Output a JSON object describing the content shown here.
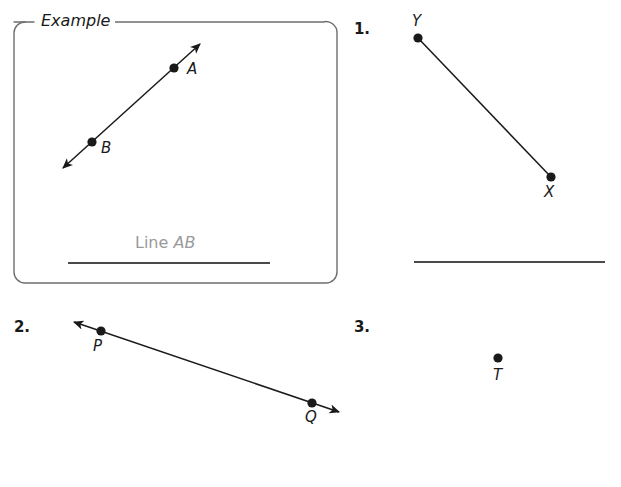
{
  "page": {
    "background_color": "#ffffff",
    "ink_color": "#1a1a1a",
    "answer_ink_color": "#9a9a9a",
    "rule_color": "#555555"
  },
  "example_box": {
    "title": "Example",
    "answer_prefix": "Line ",
    "answer_names": "AB",
    "figure": {
      "type": "line",
      "arrow_start": true,
      "arrow_end": true,
      "points": [
        {
          "label": "A",
          "x": 174,
          "y": 68
        },
        {
          "label": "B",
          "x": 92,
          "y": 142
        }
      ]
    }
  },
  "problems": [
    {
      "number": "1.",
      "figure": {
        "type": "segment",
        "arrow_start": false,
        "arrow_end": false,
        "points": [
          {
            "label": "Y",
            "x": 418,
            "y": 38
          },
          {
            "label": "X",
            "x": 551,
            "y": 177
          }
        ]
      },
      "has_answer_line": true
    },
    {
      "number": "2.",
      "figure": {
        "type": "line",
        "arrow_start": true,
        "arrow_end": true,
        "points": [
          {
            "label": "P",
            "x": 101,
            "y": 331
          },
          {
            "label": "Q",
            "x": 312,
            "y": 403
          }
        ]
      },
      "has_answer_line": false
    },
    {
      "number": "3.",
      "figure": {
        "type": "point",
        "arrow_start": false,
        "arrow_end": false,
        "points": [
          {
            "label": "T",
            "x": 498,
            "y": 358
          }
        ]
      },
      "has_answer_line": false
    }
  ]
}
